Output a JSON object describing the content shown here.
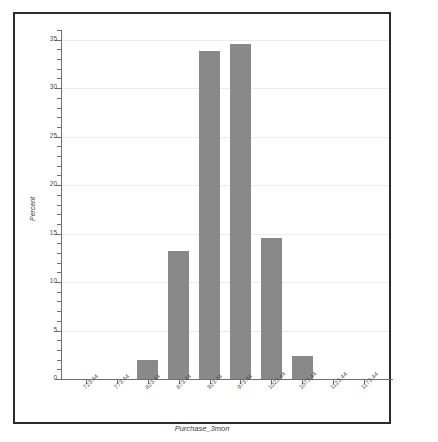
{
  "chart_data": {
    "type": "bar",
    "title": "",
    "subtitle": "",
    "xlabel": "Purchase_3mon",
    "ylabel": "Percent",
    "categories": [
      "723.44",
      "773.44",
      "823.44",
      "873.44",
      "923.44",
      "973.44",
      "1023.44",
      "1073.44",
      "1123.44",
      "1173.44"
    ],
    "values": [
      0,
      0,
      2.0,
      13.2,
      33.8,
      34.6,
      14.5,
      2.4,
      0,
      0
    ],
    "xlim": [
      698.44,
      1198.44
    ],
    "ylim": [
      0,
      36
    ],
    "yticks": [
      0,
      5,
      10,
      15,
      20,
      25,
      30,
      35
    ],
    "ytick_labels": [
      "0",
      "5",
      "10",
      "15",
      "20",
      "25",
      "30",
      "35"
    ],
    "grid": true,
    "grid_axis": "y",
    "legend": false,
    "bar_color": "#898989",
    "axis_color": "#6e6e6e",
    "grid_color": "#ececec",
    "frame_color": "#2b2b2b",
    "background": "#ffffff",
    "bin_width": 50
  },
  "chart": {
    "y_axis_title": "Percent",
    "x_axis_title": "Purchase_3mon"
  }
}
